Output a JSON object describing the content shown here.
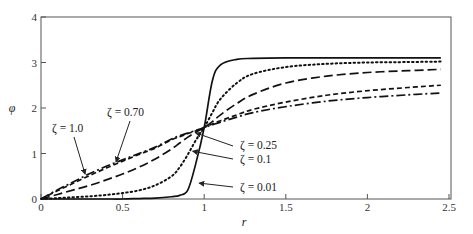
{
  "chart_data": {
    "type": "line",
    "title": "",
    "xlabel": "r",
    "ylabel": "φ",
    "xlim": [
      0,
      2.5
    ],
    "ylim": [
      0,
      4
    ],
    "grid": false,
    "x_ticks": [
      "0",
      "0.5",
      "1",
      "1.5",
      "2",
      "2.5"
    ],
    "y_ticks": [
      "0",
      "1",
      "2",
      "3",
      "4"
    ],
    "x": [
      0,
      0.1,
      0.2,
      0.3,
      0.4,
      0.5,
      0.6,
      0.7,
      0.8,
      0.85,
      0.9,
      0.95,
      1.0,
      1.05,
      1.1,
      1.2,
      1.3,
      1.5,
      1.75,
      2.0,
      2.25,
      2.45
    ],
    "series": [
      {
        "name": "ζ = 0.01",
        "style": "solid",
        "values": [
          0,
          0,
          0,
          0,
          0,
          0,
          0.01,
          0.02,
          0.05,
          0.08,
          0.2,
          0.8,
          1.57,
          2.6,
          2.95,
          3.07,
          3.09,
          3.1,
          3.1,
          3.1,
          3.1,
          3.1
        ]
      },
      {
        "name": "ζ = 0.1",
        "style": "dotted",
        "values": [
          0,
          0.02,
          0.04,
          0.06,
          0.09,
          0.13,
          0.19,
          0.3,
          0.5,
          0.7,
          0.98,
          1.3,
          1.57,
          1.9,
          2.2,
          2.55,
          2.75,
          2.9,
          2.97,
          3.0,
          3.01,
          3.02
        ]
      },
      {
        "name": "ζ = 0.25",
        "style": "long-dash",
        "values": [
          0,
          0.1,
          0.2,
          0.3,
          0.42,
          0.55,
          0.7,
          0.88,
          1.1,
          1.23,
          1.36,
          1.47,
          1.57,
          1.7,
          1.85,
          2.1,
          2.3,
          2.55,
          2.7,
          2.78,
          2.82,
          2.85
        ]
      },
      {
        "name": "ζ = 0.70",
        "style": "short-dash",
        "values": [
          0,
          0.18,
          0.35,
          0.52,
          0.68,
          0.83,
          0.98,
          1.12,
          1.3,
          1.37,
          1.44,
          1.5,
          1.57,
          1.65,
          1.72,
          1.85,
          1.97,
          2.13,
          2.28,
          2.38,
          2.45,
          2.5
        ]
      },
      {
        "name": "ζ = 1.0",
        "style": "dash-dot",
        "values": [
          0,
          0.2,
          0.38,
          0.56,
          0.72,
          0.86,
          1.0,
          1.14,
          1.32,
          1.39,
          1.45,
          1.51,
          1.57,
          1.63,
          1.69,
          1.8,
          1.9,
          2.03,
          2.15,
          2.23,
          2.29,
          2.33
        ]
      }
    ],
    "annotations": [
      {
        "text": "ζ = 1.0",
        "arrow_to": [
          0.27,
          0.55
        ]
      },
      {
        "text": "ζ = 0.70",
        "arrow_to": [
          0.46,
          0.82
        ]
      },
      {
        "text": "ζ = 0.25",
        "arrow_to": [
          0.95,
          1.45
        ]
      },
      {
        "text": "ζ = 0.1",
        "arrow_to": [
          0.93,
          1.05
        ]
      },
      {
        "text": "ζ = 0.01",
        "arrow_to": [
          0.97,
          0.35
        ]
      }
    ]
  }
}
